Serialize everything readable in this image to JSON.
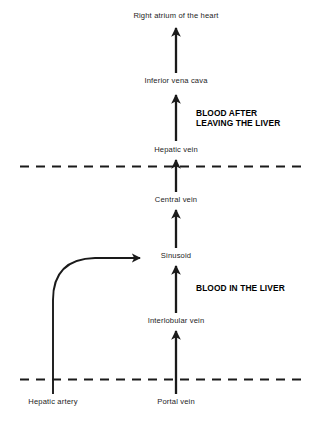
{
  "diagram": {
    "axis_x": 176,
    "colors": {
      "stroke": "#1a1a1a",
      "label_text": "#1d1d1d",
      "zone_text": "#000000",
      "background": "#ffffff"
    },
    "nodes": [
      {
        "id": "right-atrium",
        "label": "Right atrium of the heart",
        "x": 176,
        "y": 16
      },
      {
        "id": "inferior-vena-cava",
        "label": "Inferior vena cava",
        "x": 176,
        "y": 81
      },
      {
        "id": "hepatic-vein",
        "label": "Hepatic vein",
        "x": 176,
        "y": 150
      },
      {
        "id": "central-vein",
        "label": "Central vein",
        "x": 176,
        "y": 200
      },
      {
        "id": "sinusoid",
        "label": "Sinusoid",
        "x": 176,
        "y": 256
      },
      {
        "id": "interlobular-vein",
        "label": "Interlobular vein",
        "x": 176,
        "y": 321
      },
      {
        "id": "portal-vein",
        "label": "Portal vein",
        "x": 176,
        "y": 402
      },
      {
        "id": "hepatic-artery",
        "label": "Hepatic artery",
        "x": 53,
        "y": 402
      }
    ],
    "zones": [
      {
        "id": "blood-after-leaving-the-liver",
        "lines": [
          "BLOOD AFTER",
          "LEAVING THE LIVER"
        ],
        "x": 196,
        "y": 108
      },
      {
        "id": "blood-in-the-liver",
        "lines": [
          "BLOOD IN THE LIVER"
        ],
        "x": 196,
        "y": 283
      }
    ],
    "boundaries": [
      {
        "id": "upper-liver-boundary",
        "y": 166,
        "x_start": 20,
        "x_end": 305
      },
      {
        "id": "lower-liver-boundary",
        "y": 379,
        "x_start": 20,
        "x_end": 305
      }
    ],
    "arrows": [
      {
        "id": "hepatic-vein-to-inferior-vena-cava",
        "from_y": 141,
        "to_y": 93
      },
      {
        "id": "central-vein-to-hepatic-vein",
        "from_y": 192,
        "to_y": 158
      },
      {
        "id": "sinusoid-to-central-vein",
        "from_y": 248,
        "to_y": 208
      },
      {
        "id": "interlobular-vein-to-sinusoid",
        "from_y": 313,
        "to_y": 264
      },
      {
        "id": "portal-vein-to-interlobular-vein",
        "from_y": 394,
        "to_y": 329
      },
      {
        "id": "inferior-vena-cava-to-right-atrium",
        "from_y": 73,
        "to_y": 26
      }
    ],
    "curved_arrow": {
      "id": "hepatic-artery-to-sinusoid",
      "start_x": 53,
      "start_y": 394,
      "corner_y": 259,
      "tip_x": 145
    }
  }
}
